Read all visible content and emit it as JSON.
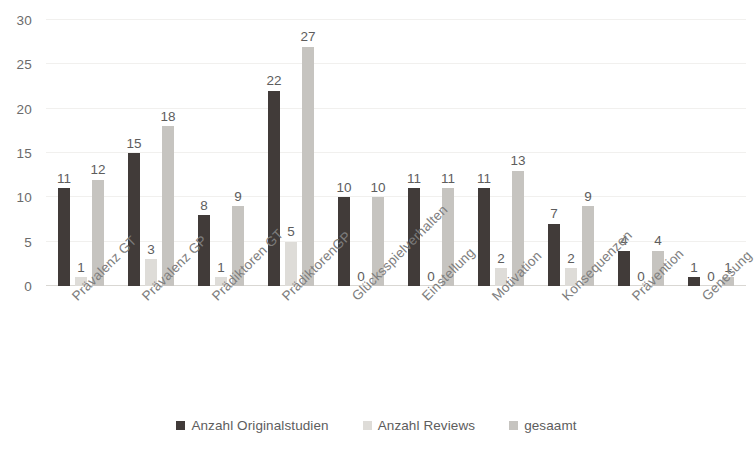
{
  "chart_data": {
    "type": "bar",
    "title": "",
    "subtitle": "",
    "xlabel": "",
    "ylabel": "",
    "ylim": [
      0,
      30
    ],
    "yticks": [
      0,
      5,
      10,
      15,
      20,
      25,
      30
    ],
    "grid": true,
    "legend_position": "bottom",
    "categories": [
      "Prävalenz GT",
      "Prävalenz GP",
      "Prädiktoren GT",
      "PrädiktorenGP",
      "Glücksspielverhalten",
      "Einstellung",
      "Motivation",
      "Konsequenzen",
      "Prävention",
      "Genesung"
    ],
    "series": [
      {
        "name": "Anzahl Originalstudien",
        "color": "#413b39",
        "values": [
          11,
          15,
          8,
          22,
          10,
          11,
          11,
          7,
          4,
          1
        ]
      },
      {
        "name": "Anzahl Reviews",
        "color": "#dedcd8",
        "values": [
          1,
          3,
          1,
          5,
          0,
          0,
          2,
          2,
          0,
          0
        ]
      },
      {
        "name": "gesaamt",
        "color": "#c6c4c0",
        "values": [
          12,
          18,
          9,
          27,
          10,
          11,
          13,
          9,
          4,
          1
        ]
      }
    ]
  },
  "axis": {
    "y_tick_labels": [
      "30",
      "25",
      "20",
      "15",
      "10",
      "5",
      "0"
    ]
  },
  "legend": {
    "items": [
      {
        "label": "Anzahl Originalstudien",
        "color": "#413b39"
      },
      {
        "label": "Anzahl Reviews",
        "color": "#dedcd8"
      },
      {
        "label": "gesaamt",
        "color": "#c6c4c0"
      }
    ]
  },
  "colors": {
    "series_1": "#413b39",
    "series_2": "#dedcd8",
    "series_3": "#c6c4c0",
    "gridline": "#f1f0ee",
    "axis": "#d9d7d3",
    "text": "#5d5d5d",
    "background": "#ffffff"
  }
}
